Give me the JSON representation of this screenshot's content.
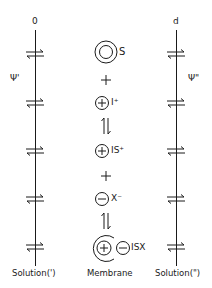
{
  "diagram": {
    "colors": {
      "ink": "#1a1a1a",
      "background": "#ffffff"
    },
    "left_boundary": {
      "position_label": "0",
      "potential_label": "Ψ'",
      "phase_label": "Solution(')"
    },
    "right_boundary": {
      "position_label": "d",
      "potential_label": "Ψ\"",
      "phase_label": "Solution(\")"
    },
    "membrane_label": "Membrane",
    "species": [
      {
        "symbol": "S",
        "icon": "double-circle-neutral-icon"
      },
      {
        "symbol": "I⁺",
        "icon": "circled-plus-icon"
      },
      {
        "symbol": "IS⁺",
        "icon": "circled-plus-icon"
      },
      {
        "symbol": "X⁻",
        "icon": "circled-minus-icon"
      },
      {
        "symbol": "ISX",
        "icon": "ion-pair-complex-icon"
      }
    ],
    "operators": [
      "+",
      "⇌",
      "+",
      "⇌"
    ],
    "exchange_arrow_count_per_boundary": 5
  }
}
